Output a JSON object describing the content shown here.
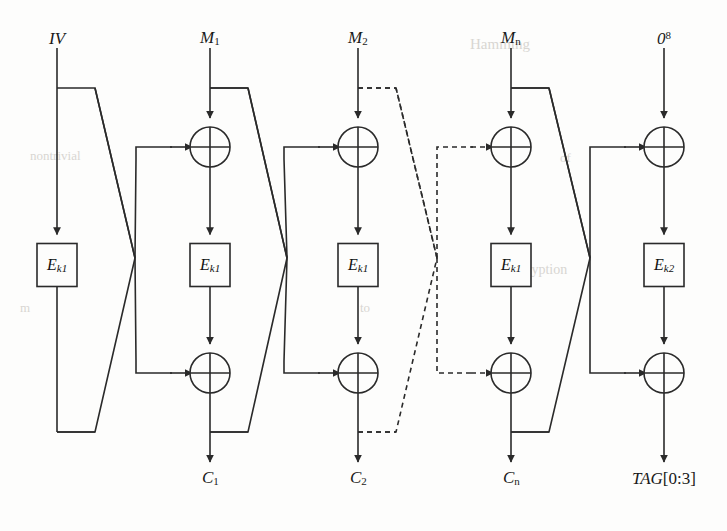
{
  "figure": {
    "background_color": "#fdfdfc",
    "line_color": "#2a2a2a",
    "text_color": "#1a1a1a"
  },
  "top_labels": [
    {
      "id": "iv",
      "text": "IV",
      "base": "IV",
      "sub": "",
      "sup": "",
      "x": 57,
      "y": 38
    },
    {
      "id": "m1",
      "text": "M1",
      "base": "M",
      "sub": "1",
      "sup": "",
      "x": 210,
      "y": 38
    },
    {
      "id": "m2",
      "text": "M2",
      "base": "M",
      "sub": "2",
      "sup": "",
      "x": 358,
      "y": 38
    },
    {
      "id": "mn",
      "text": "Mn",
      "base": "M",
      "sub": "n",
      "sup": "",
      "x": 511,
      "y": 38
    },
    {
      "id": "z8",
      "text": "08",
      "base": "0",
      "sub": "",
      "sup": "8",
      "x": 664,
      "y": 38
    }
  ],
  "bottom_labels": [
    {
      "id": "c1",
      "base": "C",
      "sub": "1",
      "suffix": "",
      "x": 210,
      "y": 478
    },
    {
      "id": "c2",
      "base": "C",
      "sub": "2",
      "suffix": "",
      "x": 358,
      "y": 478
    },
    {
      "id": "cn",
      "base": "C",
      "sub": "n",
      "suffix": "",
      "x": 511,
      "y": 478
    },
    {
      "id": "tag",
      "base": "TAG",
      "sub": "",
      "suffix": "[0:3]",
      "x": 664,
      "y": 478
    }
  ],
  "cipher_boxes": [
    {
      "id": "e-iv",
      "base": "E",
      "sub": "k1",
      "cx": 57,
      "cy": 265
    },
    {
      "id": "e-m1",
      "base": "E",
      "sub": "k1",
      "cx": 210,
      "cy": 265
    },
    {
      "id": "e-m2",
      "base": "E",
      "sub": "k1",
      "cx": 358,
      "cy": 265
    },
    {
      "id": "e-mn",
      "base": "E",
      "sub": "k1",
      "cx": 511,
      "cy": 265
    },
    {
      "id": "e-tag",
      "base": "E",
      "sub": "k2",
      "cx": 664,
      "cy": 265
    }
  ],
  "xor_nodes": [
    {
      "id": "xor-m1-top",
      "cx": 210,
      "cy": 147
    },
    {
      "id": "xor-m2-top",
      "cx": 358,
      "cy": 147
    },
    {
      "id": "xor-mn-top",
      "cx": 511,
      "cy": 147
    },
    {
      "id": "xor-tag-top",
      "cx": 664,
      "cy": 147
    },
    {
      "id": "xor-m1-bot",
      "cx": 210,
      "cy": 373
    },
    {
      "id": "xor-m2-bot",
      "cx": 358,
      "cy": 373
    },
    {
      "id": "xor-mn-bot",
      "cx": 511,
      "cy": 373
    },
    {
      "id": "xor-tag-bot",
      "cx": 664,
      "cy": 373
    }
  ],
  "crossovers": [
    {
      "id": "cross-1",
      "cx": 135,
      "style": "solid"
    },
    {
      "id": "cross-2",
      "cx": 287,
      "style": "solid"
    },
    {
      "id": "cross-3",
      "cx": 437,
      "style": "dashed"
    },
    {
      "id": "cross-4",
      "cx": 590,
      "style": "solid"
    }
  ],
  "bleed_text": [
    {
      "text": "Hamming",
      "x": 470,
      "y": 36,
      "size": 15
    },
    {
      "text": "nontrivial",
      "x": 30,
      "y": 148,
      "size": 13
    },
    {
      "text": "of",
      "x": 560,
      "y": 150,
      "size": 13
    },
    {
      "text": "Encryption",
      "x": 505,
      "y": 262,
      "size": 14
    },
    {
      "text": "m",
      "x": 20,
      "y": 300,
      "size": 13
    },
    {
      "text": "to",
      "x": 360,
      "y": 300,
      "size": 13
    }
  ]
}
